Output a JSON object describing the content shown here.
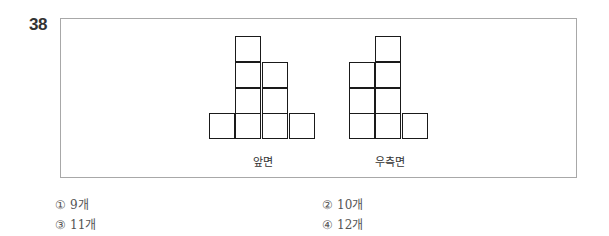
{
  "question": {
    "number": "38"
  },
  "figure": {
    "views": [
      {
        "label": "앞면",
        "column_heights": [
          1,
          4,
          3,
          1
        ]
      },
      {
        "label": "우측면",
        "column_heights": [
          3,
          4,
          1
        ]
      }
    ]
  },
  "choices": [
    {
      "mark": "①",
      "text": "9개"
    },
    {
      "mark": "②",
      "text": "10개"
    },
    {
      "mark": "③",
      "text": "11개"
    },
    {
      "mark": "④",
      "text": "12개"
    }
  ]
}
